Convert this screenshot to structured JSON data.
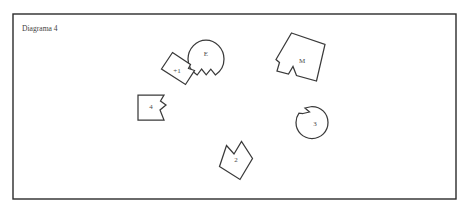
{
  "canvas": {
    "width": 468,
    "height": 215,
    "background_color": "#ffffff"
  },
  "frame": {
    "name": "diagram-border",
    "x": 13,
    "y": 14,
    "width": 443,
    "height": 185,
    "stroke_color": "#2b2b2b",
    "fill_color": "#ffffff"
  },
  "title": {
    "text": "Diagrama 4",
    "x": 22,
    "y": 31,
    "color": "#444444"
  },
  "style": {
    "piece_stroke_color": "#3a3a3a",
    "piece_fill_color": "#ffffff",
    "label_color": "#4a4a4a"
  },
  "pieces": [
    {
      "id": "piece-e",
      "label": "E",
      "shape": "circle-with-v-notch-bottom",
      "label_x": 206,
      "label_y": 54,
      "path": "M 206 40 C 215.5 40 224 48.5 224 59 C 224 65.6 220.6 71.5 215.4 74.9 L 210.8 69.2 L 206.2 74.8 L 201.6 69.0 L 197.2 75.0 C 191.8 71.6 188 65.8 188 59 C 188 48.5 196.5 40 206 40 Z"
    },
    {
      "id": "piece-plus1",
      "label": "+1",
      "shape": "rotated-square-with-right-tab",
      "label_x": 177,
      "label_y": 71,
      "path": "M 172.5 52.5 L 190.5 64.5 L 188.5 68.5 L 194.5 70.5 L 185.5 84.5 L 161.5 69.0 Z"
    },
    {
      "id": "piece-m",
      "label": "M",
      "shape": "rotated-quad-with-bottom-notch",
      "label_x": 302,
      "label_y": 61,
      "path": "M 291.5 33.0 L 325.0 44.5 L 316.5 81.0 L 296.5 75.5 L 293.0 66.5 L 288.5 74.0 L 277.0 71.0 L 279.5 62.5 L 276.0 59.5 Z"
    },
    {
      "id": "piece-4",
      "label": "4",
      "shape": "square-with-right-zigzag",
      "label_x": 151,
      "label_y": 107,
      "path": "M 138.0 95.0 L 164.0 95.0 L 160.5 101.0 L 166.0 105.0 L 160.0 110.0 L 164.0 120.0 L 138.0 120.0 Z"
    },
    {
      "id": "piece-3",
      "label": "3",
      "shape": "circle-with-notch-upper-left",
      "label_x": 315,
      "label_y": 124,
      "path": "M 303.0 113.5 L 309.5 112.0 L 305.0 108.0 L 312.0 106.5 C 321.0 106.5 328.0 113.5 328.0 122.5 C 328.0 131.5 321.0 138.5 312.0 138.5 C 303.0 138.5 296.0 131.5 296.0 122.5 C 296.0 119.0 297.1 115.8 299.0 113.2 Z"
    },
    {
      "id": "piece-2",
      "label": "2",
      "shape": "rotated-square-with-top-v-notch",
      "label_x": 236,
      "label_y": 160,
      "path": "M 226.5 145.5 L 234.0 154.0 L 241.5 141.5 L 252.5 158.5 L 240.0 179.5 L 219.5 166.5 Z"
    }
  ]
}
